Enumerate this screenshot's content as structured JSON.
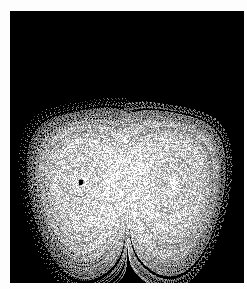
{
  "figure": {
    "title": "",
    "page_background": "#fdfdfd",
    "plot_background": "#000000",
    "point_color": "#ffffff",
    "margin_left_px": 10,
    "margin_top_px": 11,
    "plot_width_px": 234,
    "plot_height_px": 272
  },
  "chart_data": {
    "type": "scatter",
    "title": "",
    "subtitle": "",
    "xlabel": "",
    "ylabel": "",
    "xticklabels": [],
    "yticklabels": [],
    "grid": false,
    "legend": null,
    "legend_position": "none",
    "annotations": [],
    "xlim": [
      -25,
      25
    ],
    "ylim": [
      -30,
      30
    ],
    "background": "#000000",
    "marker": "point",
    "marker_size_px": 1,
    "colormap": "grayscale",
    "system": {
      "name": "Lorenz attractor",
      "equations": [
        "dx/dt = sigma*(y - x)",
        "dy/dt = x*(rho - z) - y",
        "dz/dt = x*y - beta*z"
      ],
      "sigma": 10.0,
      "rho": 28.0,
      "beta": 2.6666666666666665,
      "dt": 0.005,
      "n_points": 220000,
      "initial_condition": [
        0.01,
        0.0,
        0.0
      ],
      "projection": "x vs z"
    },
    "features": {
      "left_lobe_center_px": [
        68,
        124
      ],
      "right_lobe_center_px": [
        175,
        124
      ],
      "left_void_rx_px": 17,
      "left_void_ry_px": 35,
      "left_void_rotation_deg": 28,
      "right_void_rotation_deg": -28,
      "top_notch_apex_px": [
        122,
        150
      ],
      "bottom_cusp_px": [
        122,
        282
      ]
    }
  }
}
